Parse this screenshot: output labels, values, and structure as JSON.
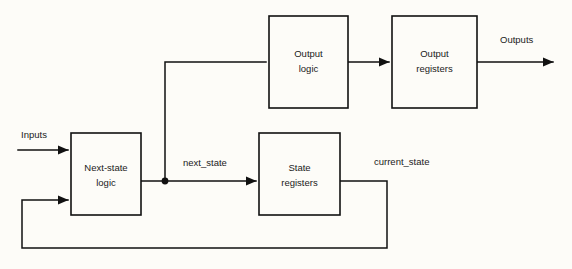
{
  "diagram": {
    "background_color": "#fdfcf8",
    "line_color": "#111111",
    "text_color": "#1a1a1a",
    "blocks": [
      {
        "id": "next_state_logic",
        "line1": "Next-state",
        "line2": "logic",
        "x": 71,
        "y": 133,
        "w": 70,
        "h": 82
      },
      {
        "id": "state_registers",
        "line1": "State",
        "line2": "registers",
        "x": 259,
        "y": 133,
        "w": 81,
        "h": 82
      },
      {
        "id": "output_logic",
        "line1": "Output",
        "line2": "logic",
        "x": 269,
        "y": 16,
        "w": 79,
        "h": 92
      },
      {
        "id": "output_registers",
        "line1": "Output",
        "line2": "registers",
        "x": 392,
        "y": 16,
        "w": 85,
        "h": 92
      }
    ],
    "signals": {
      "inputs": "Inputs",
      "next_state": "next_state",
      "current_state": "current_state",
      "outputs": "Outputs"
    }
  }
}
